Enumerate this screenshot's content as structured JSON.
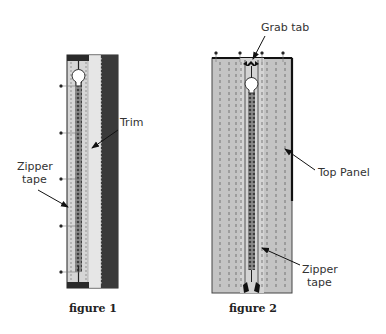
{
  "figures": [
    {
      "caption": "figure 1",
      "labels": {
        "trim": "Trim",
        "zipper_tape_line1": "Zipper",
        "zipper_tape_line2": "tape"
      }
    },
    {
      "caption": "figure 2",
      "labels": {
        "grab_tab": "Grab tab",
        "top_panel": "Top Panel",
        "zipper_tape_line1": "Zipper",
        "zipper_tape_line2": "tape"
      }
    }
  ],
  "colors": {
    "panel": "#c4c4c4",
    "tape": "#d9d9d9",
    "dark_strip": "#3a3a3a",
    "zipper_teeth": "#5a5a5a",
    "stitch": "#555555"
  }
}
